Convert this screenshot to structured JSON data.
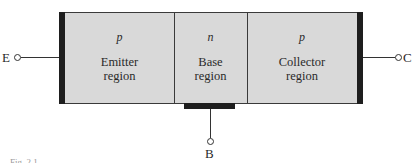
{
  "figure": {
    "caption": "Fig. 2.1",
    "colors": {
      "region_fill": "#d9d9d9",
      "contact": "#1e1e1e",
      "line": "#333333"
    }
  },
  "regions": [
    {
      "type": "p",
      "name_line1": "Emitter",
      "name_line2": "region"
    },
    {
      "type": "n",
      "name_line1": "Base",
      "name_line2": "region"
    },
    {
      "type": "p",
      "name_line1": "Collector",
      "name_line2": "region"
    }
  ],
  "terminals": {
    "emitter": "E",
    "base": "B",
    "collector": "C"
  }
}
